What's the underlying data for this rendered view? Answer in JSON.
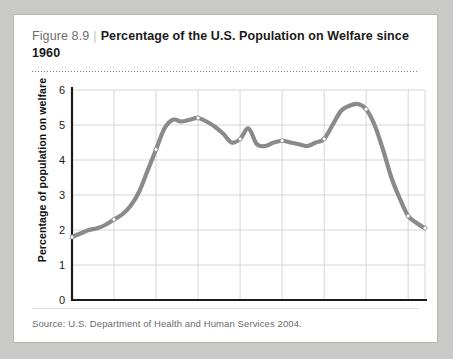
{
  "card": {
    "figure_number": "Figure 8.9",
    "separator": "|",
    "title": "Percentage of the U.S. Population on Welfare since 1960",
    "source": "Source: U.S. Department of Health and Human Services 2004."
  },
  "colors": {
    "page_background": "#c9c9c7",
    "card_background": "#ffffff",
    "card_border": "#b6b6b4",
    "line": "#8a8a8a",
    "grid": "#d6d6d6",
    "axis": "#1a1a1a",
    "marker_fill": "#ffffff",
    "title_text": "#1a1a1a",
    "figure_number_text": "#6d6d6d",
    "source_text": "#6b6b6b"
  },
  "chart_data": {
    "type": "line",
    "title": "Percentage of the U.S. Population on Welfare since 1960",
    "xlabel": "",
    "ylabel": "Percentage of population on welfare",
    "xlim": [
      1960,
      2002
    ],
    "ylim": [
      0,
      6
    ],
    "yticks": [
      0,
      1,
      2,
      3,
      4,
      5,
      6
    ],
    "ytick_labels": [
      "0",
      "1",
      "2",
      "3",
      "4",
      "5",
      "6"
    ],
    "xticks": [
      1960,
      1965,
      1970,
      1975,
      1980,
      1985,
      1990,
      1995,
      2000,
      2002
    ],
    "xtick_labels": [
      "1960",
      "1965",
      "1970",
      "1975",
      "1980",
      "1985",
      "1990",
      "1995",
      "2000",
      "2002"
    ],
    "grid": true,
    "legend": false,
    "markers_at": [
      1960,
      1965,
      1970,
      1975,
      1980,
      1985,
      1990,
      1995,
      2000,
      2002
    ],
    "x": [
      1960,
      1961,
      1962,
      1963,
      1964,
      1965,
      1966,
      1967,
      1968,
      1969,
      1970,
      1971,
      1972,
      1973,
      1974,
      1975,
      1976,
      1977,
      1978,
      1979,
      1980,
      1981,
      1982,
      1983,
      1984,
      1985,
      1986,
      1987,
      1988,
      1989,
      1990,
      1991,
      1992,
      1993,
      1994,
      1995,
      1996,
      1997,
      1998,
      1999,
      2000,
      2001,
      2002
    ],
    "values": [
      1.8,
      1.9,
      2.0,
      2.05,
      2.15,
      2.3,
      2.45,
      2.7,
      3.1,
      3.7,
      4.3,
      4.9,
      5.15,
      5.1,
      5.15,
      5.2,
      5.1,
      4.95,
      4.75,
      4.5,
      4.6,
      4.9,
      4.45,
      4.4,
      4.5,
      4.55,
      4.5,
      4.45,
      4.4,
      4.5,
      4.6,
      5.0,
      5.4,
      5.55,
      5.6,
      5.45,
      5.0,
      4.3,
      3.5,
      2.9,
      2.4,
      2.2,
      2.05
    ]
  }
}
